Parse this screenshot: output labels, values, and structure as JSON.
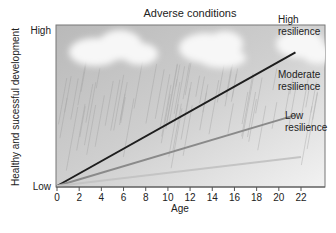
{
  "chart_data": {
    "type": "line",
    "title": "Adverse conditions",
    "xlabel": "Age",
    "ylabel": "Healthy and sucessful development",
    "xlim": [
      0,
      24
    ],
    "ylim": [
      0,
      1
    ],
    "x_ticks": [
      0,
      2,
      4,
      6,
      8,
      10,
      12,
      14,
      16,
      18,
      20,
      22
    ],
    "y_tick_labels": [
      {
        "value": 0,
        "label": "Low"
      },
      {
        "value": 1,
        "label": "High"
      }
    ],
    "grid": false,
    "series": [
      {
        "name": "High resilience",
        "label_lines": [
          "High",
          "resilience"
        ],
        "color": "#1e1e1e",
        "x": [
          0,
          21.5
        ],
        "y": [
          0,
          0.83
        ]
      },
      {
        "name": "Moderate resilience",
        "label_lines": [
          "Moderate",
          "resilience"
        ],
        "color": "#8a8a8a",
        "x": [
          0,
          21.5
        ],
        "y": [
          0,
          0.44
        ]
      },
      {
        "name": "Low resilience",
        "label_lines": [
          "Low",
          "resilience"
        ],
        "color": "#c4c4c4",
        "x": [
          0,
          22
        ],
        "y": [
          0,
          0.18
        ]
      }
    ],
    "background": "storm clouds with rain"
  }
}
